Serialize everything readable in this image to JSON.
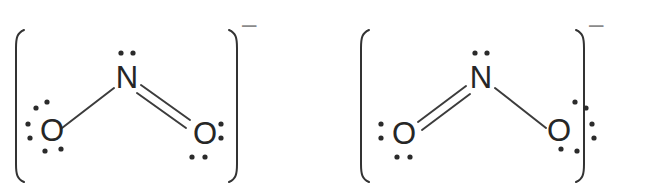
{
  "diagram": {
    "background_color": "#ffffff",
    "atom_color": "#262626",
    "bond_color": "#3c3c3c",
    "dot_color": "#2b2b2b",
    "bracket_color": "#333333",
    "charge_color": "#8a8a8a"
  },
  "structures": [
    {
      "id": "resonance-structure-1",
      "charge": "–",
      "bracket_left": "[",
      "bracket_right": "]",
      "atoms": {
        "nitrogen": {
          "symbol": "N",
          "lone_pairs": 1
        },
        "oxygen_left": {
          "symbol": "O",
          "lone_pairs": 3,
          "bond": "single"
        },
        "oxygen_right": {
          "symbol": "O",
          "lone_pairs": 2,
          "bond": "double"
        }
      },
      "bonds": [
        {
          "from": "N",
          "to": "O-left",
          "order": 1
        },
        {
          "from": "N",
          "to": "O-right",
          "order": 2
        }
      ]
    },
    {
      "id": "resonance-structure-2",
      "charge": "–",
      "bracket_left": "[",
      "bracket_right": "]",
      "atoms": {
        "nitrogen": {
          "symbol": "N",
          "lone_pairs": 1
        },
        "oxygen_left": {
          "symbol": "O",
          "lone_pairs": 2,
          "bond": "double"
        },
        "oxygen_right": {
          "symbol": "O",
          "lone_pairs": 3,
          "bond": "single"
        }
      },
      "bonds": [
        {
          "from": "N",
          "to": "O-left",
          "order": 2
        },
        {
          "from": "N",
          "to": "O-right",
          "order": 1
        }
      ]
    }
  ],
  "labels": {
    "nitrogen": "N",
    "oxygen": "O",
    "charge_minus": "–"
  }
}
